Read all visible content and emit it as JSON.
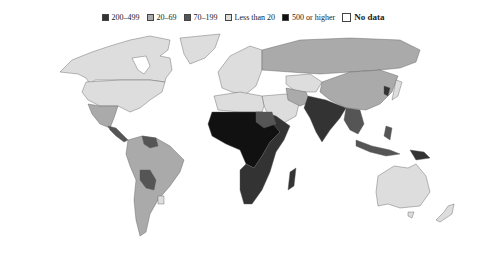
{
  "legend": {
    "items": [
      {
        "label": "200–499",
        "color": "#333333"
      },
      {
        "label": "20–69",
        "color": "#aaaaaa"
      },
      {
        "label": "70–199",
        "color": "#555555"
      },
      {
        "label": "Less than 20",
        "color": "#dddddd"
      },
      {
        "label": "500 or higher",
        "color": "#111111"
      },
      {
        "label": "No data",
        "color": "#ffffff"
      }
    ]
  },
  "map": {
    "type": "choropleth world map",
    "regions": [
      {
        "name": "North America (Canada/USA)",
        "class": "Less than 20"
      },
      {
        "name": "Greenland",
        "class": "Less than 20"
      },
      {
        "name": "Mexico",
        "class": "20–69"
      },
      {
        "name": "Central America",
        "class": "70–199"
      },
      {
        "name": "South America (most)",
        "class": "20–69"
      },
      {
        "name": "Bolivia/Paraguay",
        "class": "70–199"
      },
      {
        "name": "Guyana region",
        "class": "70–199"
      },
      {
        "name": "Uruguay",
        "class": "Less than 20"
      },
      {
        "name": "Europe",
        "class": "Less than 20"
      },
      {
        "name": "Russia",
        "class": "20–69"
      },
      {
        "name": "Kazakhstan",
        "class": "Less than 20"
      },
      {
        "name": "China",
        "class": "20–69"
      },
      {
        "name": "North Africa",
        "class": "Less than 20"
      },
      {
        "name": "West/Central Africa",
        "class": "500 or higher"
      },
      {
        "name": "East/Southern Africa",
        "class": "200–499"
      },
      {
        "name": "South Asia",
        "class": "200–499"
      },
      {
        "name": "Southeast Asia",
        "class": "70–199"
      },
      {
        "name": "Papua New Guinea",
        "class": "200–499"
      },
      {
        "name": "Australia",
        "class": "Less than 20"
      },
      {
        "name": "New Zealand",
        "class": "Less than 20"
      }
    ]
  }
}
